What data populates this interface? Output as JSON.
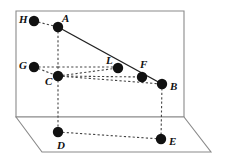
{
  "figure": {
    "width": 232,
    "height": 162,
    "background": "#ffffff",
    "stroke_solid": "#222222",
    "stroke_dashed": "#444444",
    "plane_stroke": "#8a8a8a",
    "point_fill": "#111111",
    "point_radius": 5.2
  },
  "surfaces": {
    "back_plane": {
      "name": "back-plane",
      "points": "16,11 184,11 184,117 16,117"
    },
    "floor_plane": {
      "name": "floor-plane",
      "points": "16,117 42,152 211,152 184,117"
    }
  },
  "points": [
    {
      "id": "H",
      "label": "H",
      "x": 34,
      "y": 21,
      "lx": 19,
      "ly": 14
    },
    {
      "id": "A",
      "label": "A",
      "x": 58,
      "y": 27,
      "lx": 62,
      "ly": 13
    },
    {
      "id": "G",
      "label": "G",
      "x": 34,
      "y": 67,
      "lx": 19,
      "ly": 60
    },
    {
      "id": "C",
      "label": "C",
      "x": 58,
      "y": 76,
      "lx": 45,
      "ly": 76
    },
    {
      "id": "L",
      "label": "L",
      "x": 118,
      "y": 68,
      "lx": 106,
      "ly": 55
    },
    {
      "id": "F",
      "label": "F",
      "x": 142,
      "y": 77,
      "lx": 140,
      "ly": 59
    },
    {
      "id": "B",
      "label": "B",
      "x": 162,
      "y": 84,
      "lx": 170,
      "ly": 81
    },
    {
      "id": "D",
      "label": "D",
      "x": 58,
      "y": 132,
      "lx": 57,
      "ly": 140
    },
    {
      "id": "E",
      "label": "E",
      "x": 161,
      "y": 139,
      "lx": 169,
      "ly": 136
    }
  ],
  "edges": {
    "solid": [
      {
        "name": "segment-A-B",
        "from": "A",
        "to": "B",
        "x1": 58,
        "y1": 27,
        "x2": 162,
        "y2": 84
      }
    ],
    "dashed": [
      {
        "name": "segment-H-A",
        "x1": 34,
        "y1": 21,
        "x2": 58,
        "y2": 27
      },
      {
        "name": "segment-G-C",
        "x1": 34,
        "y1": 67,
        "x2": 58,
        "y2": 76
      },
      {
        "name": "segment-A-C",
        "x1": 58,
        "y1": 27,
        "x2": 58,
        "y2": 76
      },
      {
        "name": "segment-C-D",
        "x1": 58,
        "y1": 76,
        "x2": 58,
        "y2": 132
      },
      {
        "name": "segment-G-vertical-A",
        "x1": 34,
        "y1": 67,
        "x2": 58,
        "y2": 67
      },
      {
        "name": "segment-verticalA-L",
        "x1": 58,
        "y1": 67,
        "x2": 118,
        "y2": 67
      },
      {
        "name": "segment-L-drop",
        "x1": 118,
        "y1": 67,
        "x2": 118,
        "y2": 68
      },
      {
        "name": "segment-C-L",
        "x1": 58,
        "y1": 76,
        "x2": 118,
        "y2": 68
      },
      {
        "name": "segment-C-F",
        "x1": 58,
        "y1": 76,
        "x2": 142,
        "y2": 77
      },
      {
        "name": "segment-C-B",
        "x1": 58,
        "y1": 76,
        "x2": 162,
        "y2": 84
      },
      {
        "name": "segment-B-E",
        "x1": 162,
        "y1": 84,
        "x2": 161,
        "y2": 139
      },
      {
        "name": "segment-D-E",
        "x1": 58,
        "y1": 132,
        "x2": 161,
        "y2": 139
      }
    ]
  }
}
